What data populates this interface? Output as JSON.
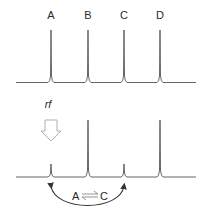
{
  "diagram": {
    "peak_labels": [
      "A",
      "B",
      "C",
      "D"
    ],
    "rf_label": "rf",
    "exchange": {
      "left": "A",
      "right": "C"
    },
    "colors": {
      "spectrum_line": "#555555",
      "text": "#2a2a2a",
      "rf_arrow": "#b0b0b0",
      "arc": "#333333"
    },
    "top_spectrum": {
      "description": "Reference spectrum, four equal peaks",
      "peaks": [
        {
          "label": "A",
          "relative_height": 1.0
        },
        {
          "label": "B",
          "relative_height": 1.0
        },
        {
          "label": "C",
          "relative_height": 1.0
        },
        {
          "label": "D",
          "relative_height": 1.0
        }
      ]
    },
    "bottom_spectrum": {
      "description": "Saturation transfer: rf irradiation at A reduces A and C",
      "peaks": [
        {
          "label": "A",
          "relative_height": 0.25
        },
        {
          "label": "B",
          "relative_height": 1.0
        },
        {
          "label": "C",
          "relative_height": 0.25
        },
        {
          "label": "D",
          "relative_height": 1.0
        }
      ]
    }
  }
}
